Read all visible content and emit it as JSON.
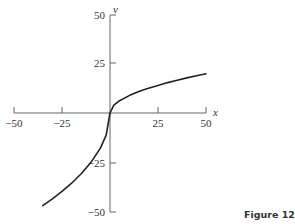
{
  "figure": {
    "caption": "Figure 12.3"
  },
  "colors": {
    "axis": "#666666",
    "curve": "#222222",
    "text": "#333333"
  },
  "chart_data": {
    "type": "line",
    "title": "",
    "xlabel": "x",
    "ylabel": "v",
    "xlim": [
      -50,
      50
    ],
    "ylim": [
      -50,
      50
    ],
    "x_ticks": [
      -50,
      -25,
      25,
      50
    ],
    "x_tick_labels": [
      "−50",
      "−25",
      "25",
      "50"
    ],
    "y_ticks": [
      50,
      25,
      -25,
      -50
    ],
    "y_tick_labels": [
      "50",
      "25",
      "−25",
      "−50"
    ],
    "grid": false,
    "legend": null,
    "series": [
      {
        "name": "v(x)",
        "x": [
          -35,
          -30,
          -25,
          -20,
          -15,
          -10,
          -5,
          -2,
          0,
          2,
          5,
          10,
          15,
          20,
          25,
          30,
          35,
          40,
          45,
          50
        ],
        "values": [
          -47.3,
          -43.8,
          -40.0,
          -35.8,
          -31.0,
          -25.3,
          -17.9,
          -11.3,
          0,
          4.0,
          6.3,
          8.9,
          11.0,
          12.6,
          14.1,
          15.5,
          16.7,
          17.9,
          19.0,
          20.0
        ]
      }
    ]
  }
}
